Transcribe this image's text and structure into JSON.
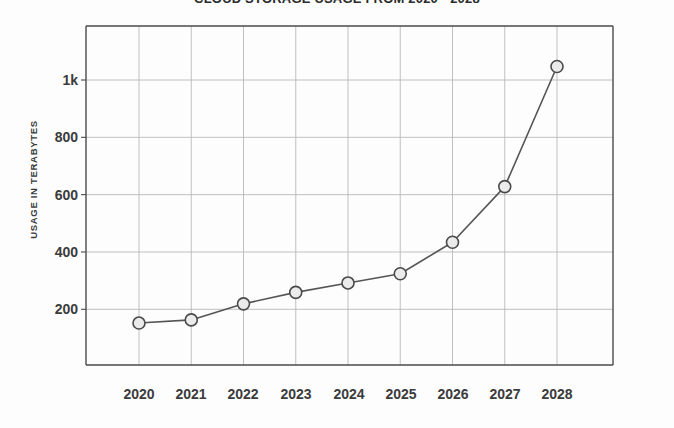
{
  "chart_data": {
    "type": "line",
    "title": "CLOUD STORAGE USAGE FROM 2020 - 2028",
    "xlabel": "",
    "ylabel": "USAGE IN TERABYTES",
    "categories": [
      "2020",
      "2021",
      "2022",
      "2023",
      "2024",
      "2025",
      "2026",
      "2027",
      "2028"
    ],
    "values": [
      152,
      163,
      219,
      259,
      292,
      324,
      434,
      628,
      1047
    ],
    "series": [
      {
        "name": "Cloud storage usage",
        "values": [
          152,
          163,
          219,
          259,
          292,
          324,
          434,
          628,
          1047
        ]
      }
    ],
    "x_tick_labels": [
      "2020",
      "2021",
      "2022",
      "2023",
      "2024",
      "2025",
      "2026",
      "2027",
      "2028"
    ],
    "y_tick_labels": [
      "200",
      "400",
      "600",
      "800",
      "1k"
    ],
    "y_tick_values": [
      200,
      400,
      600,
      800,
      1000
    ],
    "ylim": [
      0,
      1100
    ],
    "grid": true,
    "legend": "none",
    "marker": "open-circle",
    "line_color": "#555555",
    "marker_fill": "#ebebeb",
    "marker_stroke": "#4a4a4a",
    "grid_color": "#b9b9b9",
    "axis_color": "#4a4a4a",
    "text_color": "#3b3b3b",
    "background_color": "#fdfdfd"
  }
}
